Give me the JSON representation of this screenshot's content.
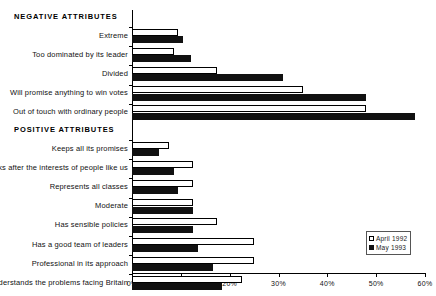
{
  "chart_data": {
    "type": "bar",
    "orientation": "horizontal",
    "title": "",
    "xlabel": "",
    "ylabel": "",
    "xlim": [
      0,
      60
    ],
    "xticks": [
      0,
      10,
      20,
      30,
      40,
      50,
      60
    ],
    "xtick_labels": [
      "0%",
      "10%",
      "20%",
      "30%",
      "40%",
      "50%",
      "60%"
    ],
    "grid": false,
    "legend_position": "bottom-right",
    "series": [
      {
        "name": "April 1992",
        "style": "hollow",
        "color": "#ffffff",
        "values": [
          9.5,
          8.5,
          17.5,
          35.0,
          48.0,
          7.5,
          12.5,
          12.5,
          12.5,
          17.5,
          25.0,
          25.0,
          22.5
        ]
      },
      {
        "name": "May 1993",
        "style": "filled",
        "color": "#111111",
        "values": [
          10.5,
          12.0,
          31.0,
          48.0,
          58.0,
          5.5,
          8.5,
          9.5,
          12.5,
          12.5,
          13.5,
          16.5,
          18.5
        ]
      }
    ],
    "categories": [
      "Extreme",
      "Too dominated by its leader",
      "Divided",
      "Will promise anything to win votes",
      "Out of touch with ordinary people",
      "Keeps all its promises",
      "Looks after the interests of people like us",
      "Represents all classes",
      "Moderate",
      "Has sensible policies",
      "Has a good team of leaders",
      "Professional in its approach",
      "Understands the problems facing Britain"
    ],
    "sections": [
      {
        "heading": "NEGATIVE ATTRIBUTES",
        "category_indices": [
          0,
          1,
          2,
          3,
          4
        ]
      },
      {
        "heading": "POSITIVE ATTRIBUTES",
        "category_indices": [
          5,
          6,
          7,
          8,
          9,
          10,
          11,
          12
        ]
      }
    ]
  },
  "legend": {
    "items": [
      {
        "label": "April 1992",
        "style": "white"
      },
      {
        "label": "May 1993",
        "style": "black"
      }
    ]
  }
}
